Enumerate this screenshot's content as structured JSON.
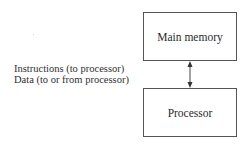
{
  "diagram": {
    "nodes": [
      {
        "id": "main-memory",
        "label": "Main memory"
      },
      {
        "id": "processor",
        "label": "Processor"
      }
    ],
    "edges": [
      {
        "from": "main-memory",
        "to": "processor",
        "direction": "bidirectional"
      }
    ],
    "edge_labels": [
      "Instructions (to processor)",
      "Data (to or from processor)"
    ],
    "colors": {
      "stroke": "#555555",
      "text": "#2a2a2a",
      "background": "#ffffff"
    }
  }
}
